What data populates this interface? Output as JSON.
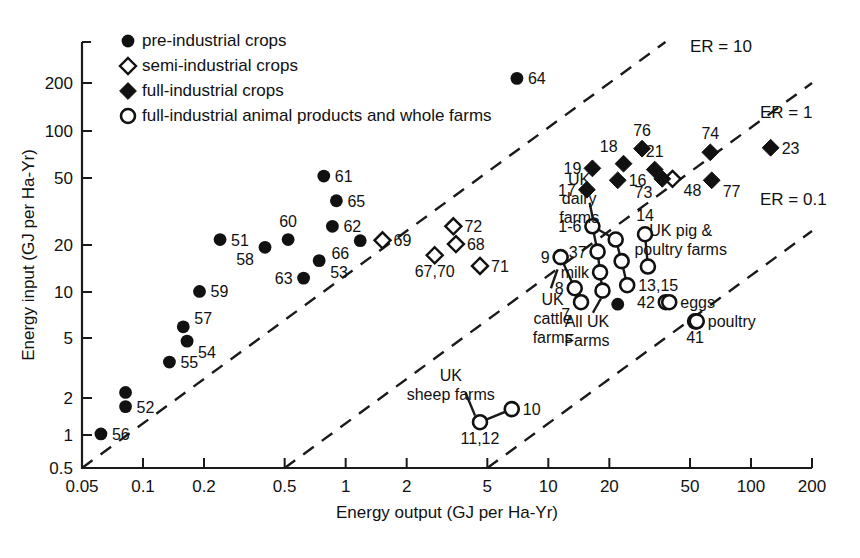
{
  "chart_data": {
    "type": "scatter",
    "title": "",
    "xlabel": "Energy output (GJ per Ha-Yr)",
    "ylabel": "Energy input (GJ per Ha-Yr)",
    "xscale": "log",
    "yscale": "log",
    "xlim": [
      0.05,
      200
    ],
    "ylim": [
      0.5,
      300
    ],
    "grid": false,
    "xticks": [
      "0.05",
      "0.1",
      "0.2",
      "0.5",
      "1",
      "2",
      "5",
      "10",
      "20",
      "50",
      "100",
      "200"
    ],
    "xtick_values": [
      0.05,
      0.1,
      0.2,
      0.5,
      1,
      2,
      5,
      10,
      20,
      50,
      100,
      200
    ],
    "yticks": [
      "0.5",
      "1",
      "2",
      "5",
      "10",
      "20",
      "50",
      "100",
      "200"
    ],
    "ytick_values": [
      0.5,
      1,
      2,
      5,
      10,
      20,
      50,
      100,
      200
    ],
    "legend": {
      "position": "top-left",
      "entries": [
        {
          "marker": "filled-circle",
          "label": "pre-industrial crops"
        },
        {
          "marker": "open-diamond",
          "label": "semi-industrial crops"
        },
        {
          "marker": "filled-diamond",
          "label": "full-industrial crops"
        },
        {
          "marker": "open-circle",
          "label": "full-industrial animal products and whole farms"
        }
      ]
    },
    "reference_lines": [
      {
        "label": "ER = 10",
        "ratio": 10
      },
      {
        "label": "ER = 1",
        "ratio": 1
      },
      {
        "label": "ER = 0.1",
        "ratio": 0.1
      }
    ],
    "series": [
      {
        "name": "pre-industrial crops",
        "marker": "filled-circle",
        "points": [
          {
            "id": "56",
            "x": 0.062,
            "y": 0.85,
            "label": "56",
            "lpos": "right"
          },
          {
            "id": "52a",
            "x": 0.082,
            "y": 1.62,
            "label": "",
            "lpos": "right"
          },
          {
            "id": "52b",
            "x": 0.082,
            "y": 1.3,
            "label": "52",
            "lpos": "right"
          },
          {
            "id": "55",
            "x": 0.135,
            "y": 2.6,
            "label": "55",
            "lpos": "right"
          },
          {
            "id": "54",
            "x": 0.165,
            "y": 3.6,
            "label": "54",
            "lpos": "right-below"
          },
          {
            "id": "57",
            "x": 0.158,
            "y": 4.5,
            "label": "57",
            "lpos": "right-above"
          },
          {
            "id": "59",
            "x": 0.19,
            "y": 7.8,
            "label": "59",
            "lpos": "right"
          },
          {
            "id": "51",
            "x": 0.24,
            "y": 17.5,
            "label": "51",
            "lpos": "right"
          },
          {
            "id": "58",
            "x": 0.4,
            "y": 15.5,
            "label": "58",
            "lpos": "left-below"
          },
          {
            "id": "60",
            "x": 0.52,
            "y": 17.5,
            "label": "60",
            "lpos": "above"
          },
          {
            "id": "63",
            "x": 0.62,
            "y": 9.6,
            "label": "63",
            "lpos": "left"
          },
          {
            "id": "53",
            "x": 0.74,
            "y": 12.6,
            "label": "53",
            "lpos": "right-below"
          },
          {
            "id": "61",
            "x": 0.78,
            "y": 47.0,
            "label": "61",
            "lpos": "right"
          },
          {
            "id": "65",
            "x": 0.9,
            "y": 32.0,
            "label": "65",
            "lpos": "right"
          },
          {
            "id": "62",
            "x": 0.86,
            "y": 21.5,
            "label": "62",
            "lpos": "right"
          },
          {
            "id": "66",
            "x": 1.18,
            "y": 17.2,
            "label": "66",
            "lpos": "left-below"
          },
          {
            "id": "64",
            "x": 7.0,
            "y": 215.0,
            "label": "64",
            "lpos": "right"
          }
        ]
      },
      {
        "name": "semi-industrial crops",
        "marker": "open-diamond",
        "points": [
          {
            "id": "69",
            "x": 1.52,
            "y": 17.3,
            "label": "69",
            "lpos": "right"
          },
          {
            "id": "72",
            "x": 3.4,
            "y": 21.5,
            "label": "72",
            "lpos": "right"
          },
          {
            "id": "68",
            "x": 3.5,
            "y": 16.3,
            "label": "68",
            "lpos": "right"
          },
          {
            "id": "67,70",
            "x": 2.75,
            "y": 13.7,
            "label": "67,70",
            "lpos": "below"
          },
          {
            "id": "71",
            "x": 4.6,
            "y": 11.6,
            "label": "71",
            "lpos": "right"
          },
          {
            "id": "48",
            "x": 41.0,
            "y": 45.0,
            "label": "48",
            "lpos": "right-below"
          }
        ]
      },
      {
        "name": "full-industrial crops",
        "marker": "filled-diamond",
        "points": [
          {
            "id": "17",
            "x": 15.5,
            "y": 38.0,
            "label": "17",
            "lpos": "left"
          },
          {
            "id": "19",
            "x": 16.5,
            "y": 53.0,
            "label": "19",
            "lpos": "left"
          },
          {
            "id": "16",
            "x": 22.0,
            "y": 44.0,
            "label": "16",
            "lpos": "right"
          },
          {
            "id": "18",
            "x": 23.5,
            "y": 57.0,
            "label": "18",
            "lpos": "above-left"
          },
          {
            "id": "76",
            "x": 29.0,
            "y": 72.0,
            "label": "76",
            "lpos": "above"
          },
          {
            "id": "21",
            "x": 33.5,
            "y": 52.0,
            "label": "21",
            "lpos": "above"
          },
          {
            "id": "73",
            "x": 36.5,
            "y": 45.0,
            "label": "73",
            "lpos": "below-left"
          },
          {
            "id": "74",
            "x": 63.0,
            "y": 68.0,
            "label": "74",
            "lpos": "above"
          },
          {
            "id": "77",
            "x": 64.0,
            "y": 44.0,
            "label": "77",
            "lpos": "right-below"
          },
          {
            "id": "23",
            "x": 125.0,
            "y": 73.0,
            "label": "23",
            "lpos": "right"
          }
        ]
      },
      {
        "name": "full-industrial animal products and whole farms",
        "marker": "open-circle",
        "points": [
          {
            "id": "1-6",
            "x": 16.5,
            "y": 21.5,
            "label": "1-6",
            "lpos": "left"
          },
          {
            "id": "37",
            "x": 17.5,
            "y": 14.5,
            "label": "37",
            "lpos": "left"
          },
          {
            "id": "milk",
            "x": 18.0,
            "y": 10.5,
            "label": "milk",
            "lpos": "left"
          },
          {
            "id": "allukfarms",
            "x": 18.5,
            "y": 7.9,
            "label": "",
            "lpos": "left"
          },
          {
            "id": "b1",
            "x": 21.5,
            "y": 17.5,
            "label": "",
            "lpos": "right"
          },
          {
            "id": "b2",
            "x": 23.0,
            "y": 12.5,
            "label": "",
            "lpos": "right"
          },
          {
            "id": "13,15",
            "x": 24.5,
            "y": 8.6,
            "label": "13,15",
            "lpos": "right"
          },
          {
            "id": "14a",
            "x": 30.0,
            "y": 19.0,
            "label": "14",
            "lpos": "above"
          },
          {
            "id": "14b",
            "x": 31.0,
            "y": 11.5,
            "label": "",
            "lpos": "right"
          },
          {
            "id": "42",
            "x": 38.0,
            "y": 6.6,
            "label": "42",
            "lpos": "left"
          },
          {
            "id": "eggs",
            "x": 39.5,
            "y": 6.6,
            "label": "eggs",
            "lpos": "right"
          },
          {
            "id": "41",
            "x": 53.0,
            "y": 4.9,
            "label": "41",
            "lpos": "below"
          },
          {
            "id": "poultry",
            "x": 54.0,
            "y": 4.9,
            "label": "poultry",
            "lpos": "right"
          },
          {
            "id": "9",
            "x": 11.5,
            "y": 13.3,
            "label": "9",
            "lpos": "left"
          },
          {
            "id": "8",
            "x": 13.5,
            "y": 8.2,
            "label": "8",
            "lpos": "left"
          },
          {
            "id": "7",
            "x": 14.5,
            "y": 6.6,
            "label": "7",
            "lpos": "left-below"
          },
          {
            "id": "11,12",
            "x": 4.6,
            "y": 1.02,
            "label": "11,12",
            "lpos": "below"
          },
          {
            "id": "10",
            "x": 6.6,
            "y": 1.25,
            "label": "10",
            "lpos": "right"
          }
        ]
      },
      {
        "name": "all-uk-farms-filled",
        "marker": "filled-circle",
        "points": [
          {
            "id": "alluk",
            "x": 22.0,
            "y": 6.4,
            "label": "",
            "lpos": "right"
          }
        ]
      }
    ],
    "connectors": [
      {
        "from": "9",
        "to": "8"
      },
      {
        "from": "1-6",
        "to": "37"
      },
      {
        "from": "37",
        "to": "milk"
      },
      {
        "from": "milk",
        "to": "allukfarms"
      },
      {
        "from": "1-6",
        "to": "b1"
      },
      {
        "from": "b1",
        "to": "b2"
      },
      {
        "from": "b2",
        "to": "13,15"
      },
      {
        "from": "14a",
        "to": "14b"
      },
      {
        "from": "11,12",
        "to": "10"
      }
    ],
    "annotations": [
      {
        "id": "uk-dairy-farms",
        "text_lines": [
          "UK",
          "dairy",
          "farms"
        ],
        "x": 14.2,
        "y": 41.0
      },
      {
        "id": "uk-pig-poultry-farms",
        "text_lines": [
          "UK pig &",
          "poultry farms"
        ],
        "x": 45.0,
        "y": 18.5
      },
      {
        "id": "uk-cattle-farms",
        "text_lines": [
          "UK",
          "cattle",
          "farms"
        ],
        "x": 10.5,
        "y": 6.3
      },
      {
        "id": "all-uk-farms",
        "text_lines": [
          "All UK",
          "Farms"
        ],
        "x": 15.5,
        "y": 4.5
      },
      {
        "id": "uk-sheep-farms",
        "text_lines": [
          "UK",
          "sheep farms"
        ],
        "x": 3.3,
        "y": 1.95
      }
    ]
  },
  "legend_items": [
    "pre-industrial crops",
    "semi-industrial crops",
    "full-industrial crops",
    "full-industrial animal products and whole farms"
  ]
}
